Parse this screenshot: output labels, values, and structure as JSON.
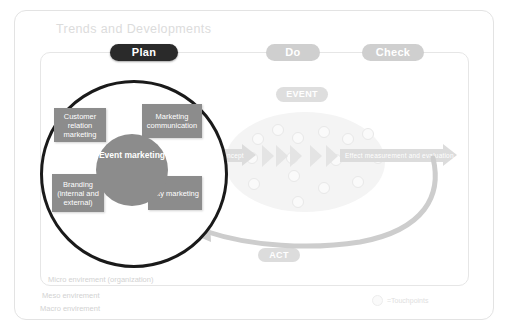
{
  "diagram": {
    "title": "Trends and Developments",
    "pdca": [
      {
        "key": "plan",
        "label": "Plan"
      },
      {
        "key": "do",
        "label": "Do"
      },
      {
        "key": "check",
        "label": "Check"
      },
      {
        "key": "act",
        "label": "ACT"
      }
    ],
    "event_badge": "EVENT",
    "core": {
      "label": "Event marketing"
    },
    "quadrants": [
      {
        "id": "tl",
        "label": "Customer relation marketing"
      },
      {
        "id": "tr",
        "label": "Marketing communication"
      },
      {
        "id": "bl",
        "label": "Branding (internal and external)"
      },
      {
        "id": "br",
        "label": "City marketing"
      }
    ],
    "process": {
      "input_arrow_label": "Event concept",
      "output_arrow_label": "Effect measurement and evaluation"
    },
    "environments": [
      "Micro envirement (organization)",
      "Meso envirement",
      "Macro envirement"
    ],
    "legend": {
      "symbol": "circle-outline-icon",
      "text": "=Touchpoints"
    },
    "colors": {
      "plan_pill": "#2a2a2a",
      "muted_pill": "#cfcfcf",
      "box_fill": "#8c8c8c",
      "circle_stroke": "#1a1a1a",
      "faded": "#e4e4e4",
      "title_text": "#dcdcdc"
    }
  }
}
